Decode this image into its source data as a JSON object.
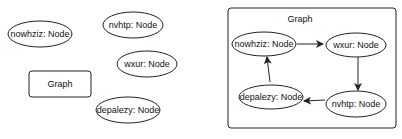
{
  "left_panel": {
    "nodes": [
      {
        "id": "nowhziz",
        "label": "nowhziz: Node"
      },
      {
        "id": "nvhtp",
        "label": "nvhtp: Node"
      },
      {
        "id": "wxur",
        "label": "wxur: Node"
      },
      {
        "id": "depalezy",
        "label": "depalezy: Node"
      }
    ],
    "graph_box_label": "Graph"
  },
  "right_panel": {
    "frame_label": "Graph",
    "nodes": [
      {
        "id": "nowhziz",
        "label": "nowhziz: Node"
      },
      {
        "id": "wxur",
        "label": "wxur: Node"
      },
      {
        "id": "nvhtp",
        "label": "nvhtp: Node"
      },
      {
        "id": "depalezy",
        "label": "depalezy: Node"
      }
    ],
    "edges": [
      {
        "from": "nowhziz",
        "to": "wxur"
      },
      {
        "from": "wxur",
        "to": "nvhtp"
      },
      {
        "from": "nvhtp",
        "to": "depalezy"
      },
      {
        "from": "depalezy",
        "to": "nowhziz"
      }
    ]
  }
}
